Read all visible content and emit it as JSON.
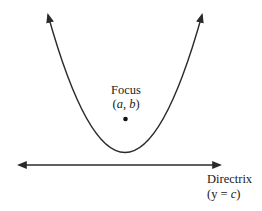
{
  "diagram": {
    "focus": {
      "label": "Focus",
      "coords_open": "(",
      "coords_a": "a",
      "coords_sep": ", ",
      "coords_b": "b",
      "coords_close": ")"
    },
    "directrix": {
      "label": "Directrix",
      "eq_open": "(y = ",
      "eq_c": "c",
      "eq_close": ")"
    },
    "colors": {
      "stroke": "#2a2a2a",
      "background": "#ffffff"
    }
  }
}
